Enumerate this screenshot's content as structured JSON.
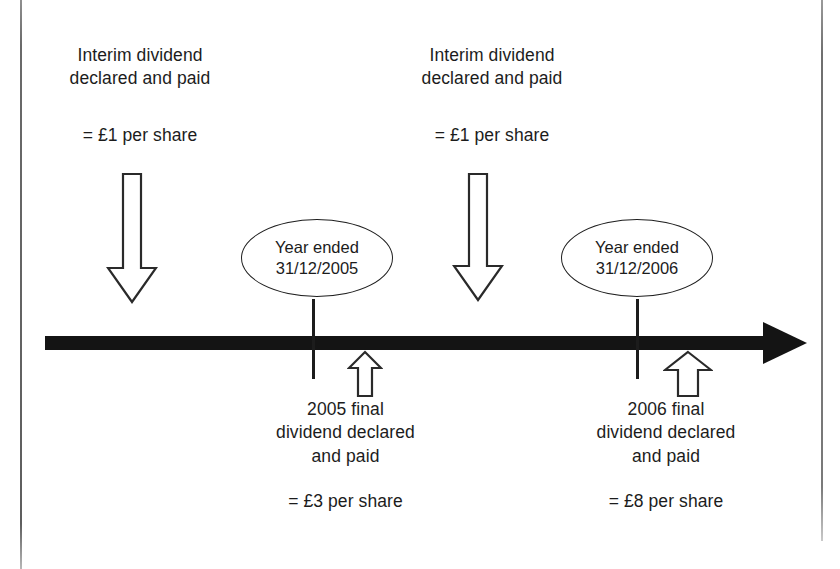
{
  "diagram": {
    "timeline": {
      "direction": "right",
      "color": "#141414",
      "ticks": [
        {
          "name": "tick-2005",
          "label": "31/12/2005"
        },
        {
          "name": "tick-2006",
          "label": "31/12/2006"
        }
      ]
    },
    "year_end_markers": [
      {
        "line1": "Year ended",
        "line2": "31/12/2005",
        "text": "Year ended\n31/12/2005"
      },
      {
        "line1": "Year ended",
        "line2": "31/12/2006",
        "text": "Year ended\n31/12/2006"
      }
    ],
    "interim_dividends": [
      {
        "title": "Interim dividend\ndeclared and paid",
        "amount": "= £1 per share",
        "arrow": "down-arrow-icon"
      },
      {
        "title": "Interim dividend\ndeclared and paid",
        "amount": "= £1 per share",
        "arrow": "down-arrow-icon"
      }
    ],
    "final_dividends": [
      {
        "title": "2005 final\ndividend declared\nand paid",
        "amount": "= £3 per share",
        "arrow": "up-arrow-icon"
      },
      {
        "title": "2006 final\ndividend declared\nand paid",
        "amount": "= £8 per share",
        "arrow": "up-arrow-icon"
      }
    ],
    "colors": {
      "ink": "#1c1c1c",
      "timeline": "#141414",
      "outline": "#2a2a2a",
      "background": "#ffffff",
      "scan_border": "#6a6a6a"
    }
  }
}
